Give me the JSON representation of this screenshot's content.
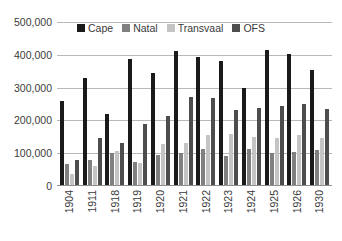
{
  "chart_data": {
    "type": "bar",
    "title": "",
    "subtitle": "",
    "xlabel": "",
    "ylabel": "",
    "ylim": [
      0,
      500000
    ],
    "ytick_labels": [
      "500,000",
      "400,000",
      "300,000",
      "200,000",
      "100,000",
      "0"
    ],
    "ytick_values": [
      500000,
      400000,
      300000,
      200000,
      100000,
      0
    ],
    "grid": true,
    "legend_position": "top-center",
    "categories": [
      "1904",
      "1911",
      "1918",
      "1919",
      "1920",
      "1921",
      "1922",
      "1923",
      "1924",
      "1925",
      "1926",
      "1930"
    ],
    "series": [
      {
        "name": "Cape",
        "color": "#1a1a1a",
        "values": [
          258000,
          330000,
          220000,
          388000,
          345000,
          413000,
          393000,
          380000,
          300000,
          415000,
          403000,
          355000
        ]
      },
      {
        "name": "Natal",
        "color": "#808080",
        "values": [
          68000,
          78000,
          100000,
          73000,
          95000,
          102000,
          112000,
          92000,
          112000,
          100000,
          105000,
          110000
        ]
      },
      {
        "name": "Transvaal",
        "color": "#c4c4c4",
        "values": [
          38000,
          62000,
          108000,
          70000,
          128000,
          130000,
          155000,
          158000,
          150000,
          145000,
          155000,
          145000
        ]
      },
      {
        "name": "OFS",
        "color": "#4d4d4d",
        "values": [
          78000,
          145000,
          132000,
          190000,
          212000,
          270000,
          268000,
          232000,
          237000,
          245000,
          250000,
          235000
        ]
      }
    ]
  },
  "legend": {
    "entries": [
      {
        "label": "Cape",
        "color": "#1a1a1a"
      },
      {
        "label": "Natal",
        "color": "#808080"
      },
      {
        "label": "Transvaal",
        "color": "#c4c4c4"
      },
      {
        "label": "OFS",
        "color": "#4d4d4d"
      }
    ]
  }
}
